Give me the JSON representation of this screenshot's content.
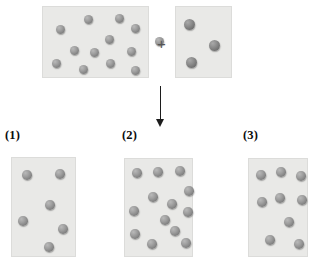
{
  "figure": {
    "operator": "+",
    "arrow": "downward-arrow"
  },
  "labels": [
    {
      "text": "(1)",
      "x": 5,
      "y": 128
    },
    {
      "text": "(2)",
      "x": 122,
      "y": 128
    },
    {
      "text": "(3)",
      "x": 243,
      "y": 128
    }
  ],
  "boxes": [
    {
      "id": "reactant-box-a",
      "name": "reactant-box-a",
      "x": 42,
      "y": 6,
      "w": 107,
      "h": 72,
      "sphere_count": 13,
      "sphere_size": 9,
      "shade": "light",
      "spheres": [
        {
          "x": 13,
          "y": 18
        },
        {
          "x": 41,
          "y": 8
        },
        {
          "x": 72,
          "y": 7
        },
        {
          "x": 88,
          "y": 17
        },
        {
          "x": 62,
          "y": 28
        },
        {
          "x": 27,
          "y": 39
        },
        {
          "x": 47,
          "y": 41
        },
        {
          "x": 84,
          "y": 40
        },
        {
          "x": 9,
          "y": 52
        },
        {
          "x": 36,
          "y": 58
        },
        {
          "x": 63,
          "y": 52
        },
        {
          "x": 88,
          "y": 59
        },
        {
          "x": 112,
          "y": 30
        }
      ]
    },
    {
      "id": "reactant-box-b",
      "name": "reactant-box-b",
      "x": 175,
      "y": 6,
      "w": 57,
      "h": 72,
      "sphere_count": 3,
      "sphere_size": 11,
      "shade": "dark",
      "spheres": [
        {
          "x": 8,
          "y": 12
        },
        {
          "x": 33,
          "y": 33
        },
        {
          "x": 10,
          "y": 50
        }
      ]
    },
    {
      "id": "answer-box-1",
      "name": "answer-box-1",
      "x": 11,
      "y": 157,
      "w": 65,
      "h": 100,
      "sphere_count": 6,
      "sphere_size": 9.5,
      "shade": "light",
      "spheres": [
        {
          "x": 10,
          "y": 12
        },
        {
          "x": 43,
          "y": 11
        },
        {
          "x": 33,
          "y": 42
        },
        {
          "x": 6,
          "y": 58
        },
        {
          "x": 46,
          "y": 66
        },
        {
          "x": 32,
          "y": 84
        }
      ]
    },
    {
      "id": "answer-box-2",
      "name": "answer-box-2",
      "x": 124,
      "y": 158,
      "w": 69,
      "h": 99,
      "sphere_count": 13,
      "sphere_size": 9.5,
      "shade": "light",
      "spheres": [
        {
          "x": 7,
          "y": 9
        },
        {
          "x": 28,
          "y": 8
        },
        {
          "x": 50,
          "y": 7
        },
        {
          "x": 59,
          "y": 27
        },
        {
          "x": 23,
          "y": 33
        },
        {
          "x": 42,
          "y": 40
        },
        {
          "x": 4,
          "y": 47
        },
        {
          "x": 58,
          "y": 48
        },
        {
          "x": 5,
          "y": 70
        },
        {
          "x": 45,
          "y": 67
        },
        {
          "x": 22,
          "y": 80
        },
        {
          "x": 56,
          "y": 79
        },
        {
          "x": 35,
          "y": 56
        }
      ]
    },
    {
      "id": "answer-box-3",
      "name": "answer-box-3",
      "x": 248,
      "y": 158,
      "w": 60,
      "h": 99,
      "sphere_count": 9,
      "sphere_size": 9.5,
      "shade": "light",
      "spheres": [
        {
          "x": 7,
          "y": 11
        },
        {
          "x": 27,
          "y": 8
        },
        {
          "x": 47,
          "y": 12
        },
        {
          "x": 8,
          "y": 38
        },
        {
          "x": 26,
          "y": 34
        },
        {
          "x": 48,
          "y": 36
        },
        {
          "x": 35,
          "y": 58
        },
        {
          "x": 16,
          "y": 76
        },
        {
          "x": 45,
          "y": 80
        }
      ]
    }
  ],
  "operator_position": {
    "x": 157,
    "y": 36
  },
  "arrow_position": {
    "x": 160,
    "y": 86,
    "length": 33
  },
  "colors": {
    "box_fill": "#e9e9e7",
    "box_border": "#dcdcda",
    "sphere": "#8e8e8e",
    "sphere_dark": "#7d7d7d",
    "arrow": "#1c1c1c",
    "label_text": "#0b0b0b",
    "background": "#ffffff"
  }
}
